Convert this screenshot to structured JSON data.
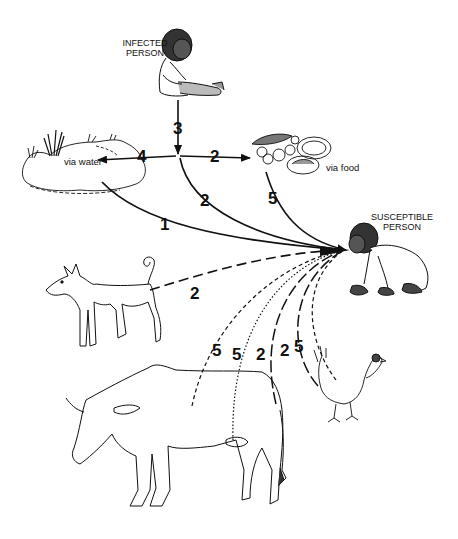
{
  "diagram": {
    "nodes": {
      "infected_person": {
        "label_line1": "INFECTED",
        "label_line2": "PERSON"
      },
      "susceptible_person": {
        "label_line1": "SUSCEPTIBLE",
        "label_line2": "PERSON"
      },
      "water": {
        "label": "via water"
      },
      "food": {
        "label": "via food"
      },
      "dog": {
        "label": ""
      },
      "cow": {
        "label": ""
      },
      "chicken": {
        "label": ""
      }
    },
    "edges": [
      {
        "from": "infected_person",
        "to": "junction",
        "number": "3",
        "style": "solid"
      },
      {
        "from": "junction",
        "to": "water",
        "number": "4",
        "style": "solid"
      },
      {
        "from": "junction",
        "to": "food",
        "number": "2",
        "style": "solid"
      },
      {
        "from": "junction",
        "to": "susceptible_person",
        "number": "2",
        "style": "solid"
      },
      {
        "from": "water",
        "to": "susceptible_person",
        "number": "1",
        "style": "solid"
      },
      {
        "from": "food",
        "to": "susceptible_person",
        "number": "5",
        "style": "solid"
      },
      {
        "from": "dog",
        "to": "susceptible_person",
        "number": "2",
        "style": "long-dash"
      },
      {
        "from": "cow",
        "to": "susceptible_person",
        "number": "5",
        "style": "dashed"
      },
      {
        "from": "cow",
        "to": "susceptible_person",
        "number": "5",
        "style": "dotted"
      },
      {
        "from": "cow",
        "to": "susceptible_person",
        "number": "2",
        "style": "long-dash"
      },
      {
        "from": "chicken",
        "to": "susceptible_person",
        "number": "2",
        "style": "long-dash"
      },
      {
        "from": "chicken",
        "to": "susceptible_person",
        "number": "5",
        "style": "dashed"
      }
    ]
  }
}
